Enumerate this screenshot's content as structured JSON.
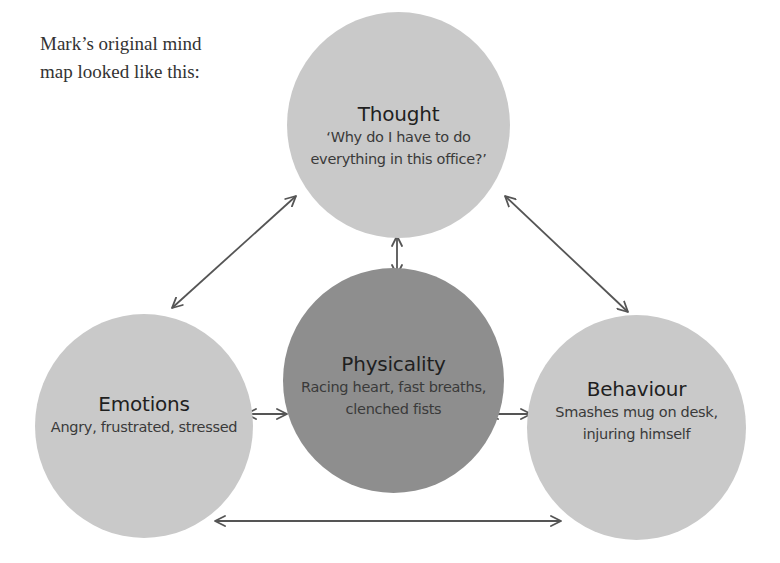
{
  "intro": {
    "line1": "Mark’s original mind",
    "line2": "map looked like this:"
  },
  "colors": {
    "outer_node": "#c9c9c9",
    "center_node": "#8e8e8e",
    "arrow": "#555555",
    "text": "#222222"
  },
  "nodes": {
    "thought": {
      "title": "Thought",
      "body": [
        "‘Why do I have to do",
        "everything in this office?’"
      ]
    },
    "physicality": {
      "title": "Physicality",
      "body": [
        "Racing heart, fast breaths,",
        "clenched fists"
      ]
    },
    "emotions": {
      "title": "Emotions",
      "body": [
        "Angry, frustrated, stressed"
      ]
    },
    "behaviour": {
      "title": "Behaviour",
      "body": [
        "Smashes mug on desk,",
        "injuring himself"
      ]
    }
  },
  "connections": [
    {
      "from": "thought",
      "to": "emotions",
      "type": "bidirectional"
    },
    {
      "from": "thought",
      "to": "physicality",
      "type": "bidirectional"
    },
    {
      "from": "thought",
      "to": "behaviour",
      "type": "bidirectional"
    },
    {
      "from": "emotions",
      "to": "physicality",
      "type": "bidirectional"
    },
    {
      "from": "physicality",
      "to": "behaviour",
      "type": "bidirectional"
    },
    {
      "from": "emotions",
      "to": "behaviour",
      "type": "bidirectional"
    }
  ]
}
